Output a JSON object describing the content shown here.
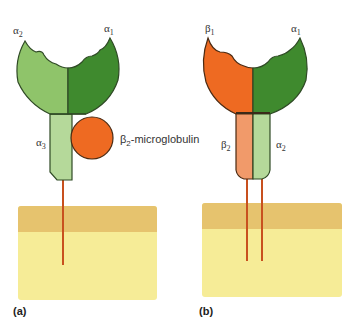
{
  "panels": [
    {
      "id": "a",
      "label": "(a)",
      "molecule": "MHC class I",
      "domains": {
        "alpha1": {
          "greek": "α",
          "sub": "1"
        },
        "alpha2": {
          "greek": "α",
          "sub": "2"
        },
        "alpha3": {
          "greek": "α",
          "sub": "3"
        }
      },
      "associated": {
        "greek": "β",
        "sub": "2",
        "suffix": "-microglobulin"
      }
    },
    {
      "id": "b",
      "label": "(b)",
      "molecule": "MHC class II",
      "domains": {
        "beta1": {
          "greek": "β",
          "sub": "1"
        },
        "alpha1": {
          "greek": "α",
          "sub": "1"
        },
        "beta2": {
          "greek": "β",
          "sub": "2"
        },
        "alpha2": {
          "greek": "α",
          "sub": "2"
        }
      }
    }
  ],
  "colors": {
    "light_green": "#8fc46a",
    "dark_green": "#3f8a2e",
    "pale_green": "#b5d99a",
    "orange": "#ee6a22",
    "light_orange": "#f19a6a",
    "outline": "#2f4a25",
    "membrane_top": "#e6c36e",
    "membrane_body": "#f6ec97",
    "tm_line": "#c8501e"
  }
}
